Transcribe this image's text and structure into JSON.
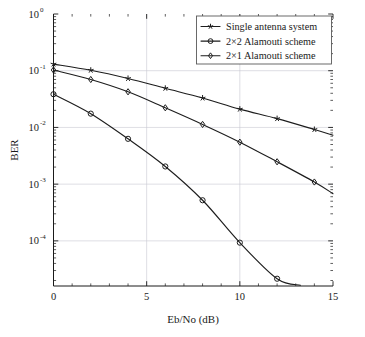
{
  "chart_data": {
    "type": "line",
    "title": "",
    "xlabel": "Eb/No (dB)",
    "ylabel": "BER",
    "xlim": [
      0,
      15
    ],
    "ylim": [
      1.6e-05,
      1.0
    ],
    "yscale": "log",
    "xscale": "linear",
    "grid": true,
    "legend_position": "top-right",
    "x": [
      0,
      2,
      4,
      6,
      8,
      10,
      12,
      14
    ],
    "xticks": [
      "0",
      "5",
      "10",
      "15"
    ],
    "xtick_values": [
      0,
      5,
      10,
      15
    ],
    "ytick_values": [
      1,
      0.1,
      0.01,
      0.001,
      0.0001
    ],
    "yticks": [
      {
        "base": "10",
        "exp": "0"
      },
      {
        "base": "10",
        "exp": "-1"
      },
      {
        "base": "10",
        "exp": "-2"
      },
      {
        "base": "10",
        "exp": "-3"
      },
      {
        "base": "10",
        "exp": "-4"
      }
    ],
    "series": [
      {
        "name": "Single antenna system",
        "marker": "star",
        "values": [
          0.131,
          0.102,
          0.073,
          0.049,
          0.033,
          0.021,
          0.0143,
          0.0092
        ],
        "tail_x": 15,
        "tail_y": 0.0073
      },
      {
        "name": "2×2 Alamouti scheme",
        "marker": "circle",
        "values": [
          0.0385,
          0.0175,
          0.0063,
          0.00205,
          0.00052,
          9.3e-05,
          2.15e-05,
          4.5e-06
        ],
        "tail_x": 13.25,
        "tail_y": 1.65e-05
      },
      {
        "name": "2×1 Alamouti scheme",
        "marker": "diamond",
        "values": [
          0.103,
          0.07,
          0.0425,
          0.0222,
          0.0113,
          0.0055,
          0.00248,
          0.00109
        ],
        "tail_x": 15,
        "tail_y": 0.00068
      }
    ]
  },
  "legend": {
    "entries": [
      {
        "label": "Single antenna system",
        "marker": "star-marker-icon"
      },
      {
        "label": "2×2 Alamouti scheme",
        "marker": "circle-marker-icon"
      },
      {
        "label": "2×1 Alamouti scheme",
        "marker": "diamond-marker-icon"
      }
    ]
  },
  "colors": {
    "line": "#1d1d1d",
    "grid": "#c8c8d2",
    "axis": "#1a1a1a",
    "background": "#ffffff",
    "legend_border": "#5a5a5a"
  }
}
